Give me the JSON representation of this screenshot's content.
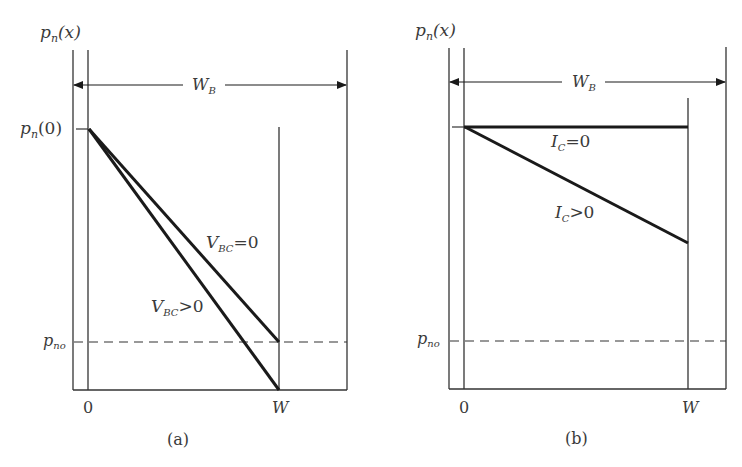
{
  "figure": {
    "colors": {
      "line": "#1a1a1a",
      "thin_line": "#333333",
      "text": "#3a3a3a"
    },
    "panels": [
      {
        "id": "a",
        "caption": "(a)",
        "y_axis_label": {
          "base": "p",
          "sub": "n",
          "rest": "(x)"
        },
        "width_label": {
          "base": "W",
          "sub": "B"
        },
        "tick_top": {
          "base": "p",
          "sub": "n",
          "rest": "(0)"
        },
        "tick_bottom": {
          "base": "p",
          "sub": "no"
        },
        "x_ticks": [
          "0",
          "W"
        ],
        "curves": [
          {
            "label_base": "V",
            "label_sub": "BC",
            "label_rest": "=0",
            "description": "linear from p_n(0) at x=0 to p_no at x=W"
          },
          {
            "label_base": "V",
            "label_sub": "BC",
            "label_rest": ">0",
            "description": "linear from p_n(0) at x=0 to 0 at x=W"
          }
        ]
      },
      {
        "id": "b",
        "caption": "(b)",
        "y_axis_label": {
          "base": "p",
          "sub": "n",
          "rest": "(x)"
        },
        "width_label": {
          "base": "W",
          "sub": "B"
        },
        "tick_bottom": {
          "base": "p",
          "sub": "no"
        },
        "x_ticks": [
          "0",
          "W"
        ],
        "curves": [
          {
            "label_base": "I",
            "label_sub": "C",
            "label_rest": "=0",
            "description": "flat at p_n(0) from x=0 to x=W"
          },
          {
            "label_base": "I",
            "label_sub": "C",
            "label_rest": ">0",
            "description": "linear decrease from p_n(0) to an intermediate value at x=W"
          }
        ]
      }
    ]
  }
}
